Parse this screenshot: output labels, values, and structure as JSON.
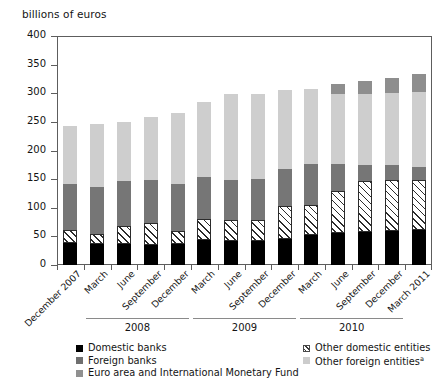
{
  "chart_data": {
    "type": "bar",
    "subtype": "stacked-vertical",
    "title": "",
    "ylabel": "billions of euros",
    "xlabel": "",
    "ylim": [
      0,
      400
    ],
    "yticks": [
      0,
      50,
      100,
      150,
      200,
      250,
      300,
      350,
      400
    ],
    "grid": false,
    "legend_position": "bottom",
    "categories": [
      "December 2007",
      "March",
      "June",
      "September",
      "December",
      "March",
      "June",
      "September",
      "December",
      "March",
      "June",
      "September",
      "December",
      "March 2011"
    ],
    "year_groups": [
      {
        "label": "2008",
        "start_index": 1,
        "end_index": 4
      },
      {
        "label": "2009",
        "start_index": 5,
        "end_index": 8
      },
      {
        "label": "2010",
        "start_index": 9,
        "end_index": 12
      }
    ],
    "series": [
      {
        "name": "Domestic banks",
        "color": "#000000",
        "swatch": "solid-black",
        "values": [
          38,
          36,
          36,
          35,
          37,
          44,
          42,
          42,
          45,
          53,
          56,
          58,
          60,
          61
        ]
      },
      {
        "name": "Other domestic entities",
        "color": "#ffffff",
        "swatch": "hatched",
        "values": [
          24,
          19,
          33,
          39,
          23,
          37,
          37,
          36,
          58,
          52,
          73,
          89,
          89,
          87
        ]
      },
      {
        "name": "Foreign banks",
        "color": "#767676",
        "swatch": "dark-gray",
        "values": [
          79,
          81,
          77,
          74,
          81,
          73,
          69,
          72,
          65,
          71,
          48,
          27,
          25,
          24
        ]
      },
      {
        "name": "Other foreign entities",
        "color": "#cecece",
        "swatch": "light-gray",
        "values": [
          102,
          110,
          103,
          110,
          125,
          131,
          150,
          149,
          137,
          131,
          122,
          124,
          126,
          130
        ]
      },
      {
        "name": "Euro area and International Monetary Fund",
        "color": "#8e8e8e",
        "swatch": "medium-gray",
        "values": [
          0,
          0,
          0,
          0,
          0,
          0,
          0,
          0,
          0,
          0,
          17,
          24,
          27,
          31
        ]
      }
    ],
    "totals": [
      243,
      246,
      249,
      258,
      266,
      285,
      298,
      299,
      305,
      307,
      316,
      322,
      327,
      333
    ]
  },
  "legend": {
    "left_column": [
      {
        "label": "Domestic banks",
        "swatch": "lsw-dom-banks",
        "footnote": ""
      },
      {
        "label": "Foreign banks",
        "swatch": "lsw-for-banks",
        "footnote": ""
      },
      {
        "label": "Euro area and International Monetary Fund",
        "swatch": "lsw-euro-imf",
        "footnote": ""
      }
    ],
    "right_column": [
      {
        "label": "Other domestic entities",
        "swatch": "lsw-dom-other",
        "footnote": ""
      },
      {
        "label": "Other foreign entities",
        "swatch": "lsw-for-other",
        "footnote": "a"
      }
    ]
  }
}
